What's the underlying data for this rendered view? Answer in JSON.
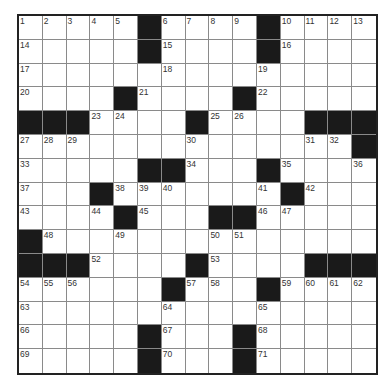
{
  "puzzle": {
    "rows": 15,
    "cols": 15,
    "colors": {
      "block": "#1a1a1a",
      "cell": "#ffffff",
      "gridline": "#8a8a8a",
      "border": "#222222"
    },
    "blocks": [
      [
        0,
        5
      ],
      [
        0,
        10
      ],
      [
        1,
        5
      ],
      [
        1,
        10
      ],
      [
        3,
        4
      ],
      [
        3,
        9
      ],
      [
        4,
        0
      ],
      [
        4,
        1
      ],
      [
        4,
        2
      ],
      [
        4,
        7
      ],
      [
        4,
        12
      ],
      [
        4,
        13
      ],
      [
        4,
        14
      ],
      [
        5,
        14
      ],
      [
        6,
        5
      ],
      [
        6,
        6
      ],
      [
        6,
        10
      ],
      [
        7,
        3
      ],
      [
        7,
        11
      ],
      [
        8,
        4
      ],
      [
        8,
        8
      ],
      [
        8,
        9
      ],
      [
        9,
        0
      ],
      [
        10,
        0
      ],
      [
        10,
        1
      ],
      [
        10,
        2
      ],
      [
        10,
        7
      ],
      [
        10,
        12
      ],
      [
        10,
        13
      ],
      [
        10,
        14
      ],
      [
        11,
        6
      ],
      [
        11,
        10
      ],
      [
        13,
        5
      ],
      [
        13,
        9
      ],
      [
        14,
        5
      ],
      [
        14,
        9
      ]
    ],
    "numbers": [
      {
        "r": 0,
        "c": 0,
        "n": "1"
      },
      {
        "r": 0,
        "c": 1,
        "n": "2"
      },
      {
        "r": 0,
        "c": 2,
        "n": "3"
      },
      {
        "r": 0,
        "c": 3,
        "n": "4"
      },
      {
        "r": 0,
        "c": 4,
        "n": "5"
      },
      {
        "r": 0,
        "c": 6,
        "n": "6"
      },
      {
        "r": 0,
        "c": 7,
        "n": "7"
      },
      {
        "r": 0,
        "c": 8,
        "n": "8"
      },
      {
        "r": 0,
        "c": 9,
        "n": "9"
      },
      {
        "r": 0,
        "c": 11,
        "n": "10"
      },
      {
        "r": 0,
        "c": 12,
        "n": "11"
      },
      {
        "r": 0,
        "c": 13,
        "n": "12"
      },
      {
        "r": 0,
        "c": 14,
        "n": "13"
      },
      {
        "r": 1,
        "c": 0,
        "n": "14"
      },
      {
        "r": 1,
        "c": 6,
        "n": "15"
      },
      {
        "r": 1,
        "c": 11,
        "n": "16"
      },
      {
        "r": 2,
        "c": 0,
        "n": "17"
      },
      {
        "r": 2,
        "c": 6,
        "n": "18"
      },
      {
        "r": 2,
        "c": 10,
        "n": "19"
      },
      {
        "r": 3,
        "c": 0,
        "n": "20"
      },
      {
        "r": 3,
        "c": 5,
        "n": "21"
      },
      {
        "r": 3,
        "c": 10,
        "n": "22"
      },
      {
        "r": 4,
        "c": 3,
        "n": "23"
      },
      {
        "r": 4,
        "c": 4,
        "n": "24"
      },
      {
        "r": 4,
        "c": 8,
        "n": "25"
      },
      {
        "r": 4,
        "c": 9,
        "n": "26"
      },
      {
        "r": 5,
        "c": 0,
        "n": "27"
      },
      {
        "r": 5,
        "c": 1,
        "n": "28"
      },
      {
        "r": 5,
        "c": 2,
        "n": "29"
      },
      {
        "r": 5,
        "c": 7,
        "n": "30"
      },
      {
        "r": 5,
        "c": 12,
        "n": "31"
      },
      {
        "r": 5,
        "c": 13,
        "n": "32"
      },
      {
        "r": 6,
        "c": 0,
        "n": "33"
      },
      {
        "r": 6,
        "c": 7,
        "n": "34"
      },
      {
        "r": 6,
        "c": 11,
        "n": "35"
      },
      {
        "r": 6,
        "c": 14,
        "n": "36"
      },
      {
        "r": 7,
        "c": 0,
        "n": "37"
      },
      {
        "r": 7,
        "c": 4,
        "n": "38"
      },
      {
        "r": 7,
        "c": 5,
        "n": "39"
      },
      {
        "r": 7,
        "c": 6,
        "n": "40"
      },
      {
        "r": 7,
        "c": 10,
        "n": "41"
      },
      {
        "r": 7,
        "c": 12,
        "n": "42"
      },
      {
        "r": 8,
        "c": 0,
        "n": "43"
      },
      {
        "r": 8,
        "c": 3,
        "n": "44"
      },
      {
        "r": 8,
        "c": 5,
        "n": "45"
      },
      {
        "r": 8,
        "c": 10,
        "n": "46"
      },
      {
        "r": 8,
        "c": 11,
        "n": "47"
      },
      {
        "r": 9,
        "c": 1,
        "n": "48"
      },
      {
        "r": 9,
        "c": 4,
        "n": "49"
      },
      {
        "r": 9,
        "c": 8,
        "n": "50"
      },
      {
        "r": 9,
        "c": 9,
        "n": "51"
      },
      {
        "r": 10,
        "c": 3,
        "n": "52"
      },
      {
        "r": 10,
        "c": 8,
        "n": "53"
      },
      {
        "r": 11,
        "c": 0,
        "n": "54"
      },
      {
        "r": 11,
        "c": 1,
        "n": "55"
      },
      {
        "r": 11,
        "c": 2,
        "n": "56"
      },
      {
        "r": 11,
        "c": 7,
        "n": "57"
      },
      {
        "r": 11,
        "c": 8,
        "n": "58"
      },
      {
        "r": 11,
        "c": 11,
        "n": "59"
      },
      {
        "r": 11,
        "c": 12,
        "n": "60"
      },
      {
        "r": 11,
        "c": 13,
        "n": "61"
      },
      {
        "r": 11,
        "c": 14,
        "n": "62"
      },
      {
        "r": 12,
        "c": 0,
        "n": "63"
      },
      {
        "r": 12,
        "c": 6,
        "n": "64"
      },
      {
        "r": 12,
        "c": 10,
        "n": "65"
      },
      {
        "r": 13,
        "c": 0,
        "n": "66"
      },
      {
        "r": 13,
        "c": 6,
        "n": "67"
      },
      {
        "r": 13,
        "c": 10,
        "n": "68"
      },
      {
        "r": 14,
        "c": 0,
        "n": "69"
      },
      {
        "r": 14,
        "c": 6,
        "n": "70"
      },
      {
        "r": 14,
        "c": 10,
        "n": "71"
      }
    ]
  }
}
